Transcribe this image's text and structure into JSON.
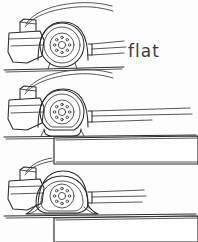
{
  "figure": {
    "background_color": "#fdfdfd",
    "ink_color": "#2b2b2b",
    "width": 198,
    "height": 242
  },
  "labels": {
    "flat": "flat"
  },
  "panels": [
    {
      "id": "panel-top",
      "name": "wheel-normal",
      "order": 1,
      "deflection": "none",
      "ground_line_y": 69,
      "ground_line_x_start": 4,
      "ground_line_x_end": 124,
      "wheel_center_x": 62,
      "wheel_center_y": 45,
      "wheel_radius": 22,
      "lug_count": 8
    },
    {
      "id": "panel-middle",
      "name": "wheel-partly-flat",
      "order": 2,
      "deflection": "partial",
      "ground_line_y": 136,
      "ground_line_x_start": 4,
      "ground_line_x_end": 196,
      "wheel_center_x": 62,
      "wheel_center_y": 112,
      "wheel_radius": 22,
      "lug_count": 8
    },
    {
      "id": "panel-bottom",
      "name": "wheel-fully-flat",
      "order": 3,
      "deflection": "full",
      "ground_line_y": 215,
      "ground_line_x_start": 4,
      "ground_line_x_end": 196,
      "wheel_center_x": 62,
      "wheel_center_y": 196,
      "wheel_radius": 22,
      "lug_count": 8
    }
  ],
  "blocks": [
    {
      "id": "block-upper",
      "name": "step-block-upper",
      "x": 54,
      "y": 138,
      "width": 144,
      "height": 26
    },
    {
      "id": "block-lower",
      "name": "step-block-lower",
      "x": 54,
      "y": 217,
      "width": 144,
      "height": 25
    }
  ]
}
